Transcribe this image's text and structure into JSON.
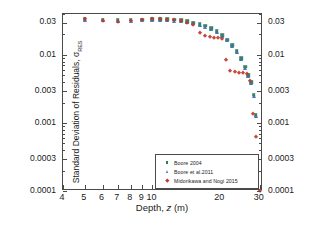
{
  "figure": {
    "background": "#ffffff",
    "frame_color": "#4a4a4a"
  },
  "axes": {
    "x_title_main": "Depth, ",
    "x_title_var": "z",
    "x_title_unit": " (m)",
    "y_title": "Standard Deviation of Residuals, σ",
    "y_title_sub": "RES"
  },
  "legend": {
    "position": "lower-right-inside",
    "entries": [
      {
        "label": "Boore 2004",
        "color": "#2e7d4f",
        "marker": "square"
      },
      {
        "label": "Boore et al.2011",
        "color": "#3d6fb5",
        "marker": "triangle"
      },
      {
        "label": "Midorikawa and Nogi 2015",
        "color": "#c0392b",
        "marker": "diamond"
      }
    ]
  },
  "caption": "",
  "chart_data": {
    "type": "scatter",
    "title": "",
    "xlabel": "Depth, z (m)",
    "ylabel": "Standard Deviation of Residuals, σRES",
    "xscale": "log",
    "yscale": "log",
    "xlim": [
      4,
      31
    ],
    "ylim": [
      0.0001,
      0.04
    ],
    "grid": false,
    "xticks_major": [
      4,
      5,
      6,
      7,
      8,
      9,
      10,
      20,
      30
    ],
    "xticklabels": [
      "4",
      "5",
      "6",
      "7",
      "8",
      "9",
      "10",
      "20",
      "30"
    ],
    "yticks_major": [
      0.0001,
      0.0003,
      0.001,
      0.003,
      0.01,
      0.03
    ],
    "yticklabels": [
      "0.0001",
      "0.0003",
      "0.001",
      "0.003",
      "0.01",
      "0.03"
    ],
    "series": [
      {
        "name": "Boore 2004",
        "color": "#2e7d4f",
        "marker": "square",
        "points": [
          [
            5.0,
            0.0335
          ],
          [
            6.0,
            0.0332
          ],
          [
            7.0,
            0.033
          ],
          [
            8.0,
            0.033
          ],
          [
            9.0,
            0.0332
          ],
          [
            10.0,
            0.0333
          ],
          [
            10.8,
            0.0334
          ],
          [
            11.6,
            0.0333
          ],
          [
            12.5,
            0.0328
          ],
          [
            13.4,
            0.0322
          ],
          [
            14.3,
            0.0313
          ],
          [
            15.2,
            0.03
          ],
          [
            16.2,
            0.0285
          ],
          [
            17.2,
            0.0268
          ],
          [
            18.2,
            0.0248
          ],
          [
            19.3,
            0.0222
          ],
          [
            20.4,
            0.0196
          ],
          [
            21.5,
            0.0168
          ],
          [
            22.6,
            0.014
          ],
          [
            23.7,
            0.0113
          ],
          [
            24.8,
            0.0089
          ],
          [
            25.8,
            0.0067
          ],
          [
            26.7,
            0.005
          ],
          [
            27.5,
            0.004
          ],
          [
            28.2,
            0.0026
          ],
          [
            28.8,
            0.0013
          ]
        ]
      },
      {
        "name": "Boore et al.2011",
        "color": "#3d6fb5",
        "marker": "triangle",
        "points": [
          [
            5.0,
            0.0332
          ],
          [
            6.0,
            0.0326
          ],
          [
            7.0,
            0.032
          ],
          [
            8.0,
            0.032
          ],
          [
            9.0,
            0.0322
          ],
          [
            10.0,
            0.0323
          ],
          [
            10.8,
            0.0324
          ],
          [
            11.6,
            0.0322
          ],
          [
            12.5,
            0.0318
          ],
          [
            13.4,
            0.0312
          ],
          [
            14.3,
            0.0303
          ],
          [
            15.2,
            0.0291
          ],
          [
            16.2,
            0.0277
          ],
          [
            17.2,
            0.026
          ],
          [
            18.2,
            0.0241
          ],
          [
            19.3,
            0.0216
          ],
          [
            20.4,
            0.0191
          ],
          [
            21.5,
            0.0164
          ],
          [
            22.6,
            0.0137
          ],
          [
            23.7,
            0.011
          ],
          [
            24.8,
            0.0087
          ],
          [
            25.8,
            0.0065
          ],
          [
            26.7,
            0.0049
          ],
          [
            27.5,
            0.0039
          ],
          [
            28.2,
            0.0025
          ],
          [
            28.8,
            0.00125
          ]
        ]
      },
      {
        "name": "Midorikawa and Nogi 2015",
        "color": "#c0392b",
        "marker": "diamond",
        "points": [
          [
            5.0,
            0.0333
          ],
          [
            6.0,
            0.032
          ],
          [
            7.0,
            0.0305
          ],
          [
            8.0,
            0.0318
          ],
          [
            9.0,
            0.033
          ],
          [
            10.0,
            0.0334
          ],
          [
            10.8,
            0.0335
          ],
          [
            11.6,
            0.033
          ],
          [
            12.5,
            0.0322
          ],
          [
            13.4,
            0.0312
          ],
          [
            14.3,
            0.0298
          ],
          [
            15.2,
            0.028
          ],
          [
            16.2,
            0.021
          ],
          [
            17.2,
            0.0188
          ],
          [
            18.0,
            0.0183
          ],
          [
            18.8,
            0.018
          ],
          [
            19.6,
            0.0176
          ],
          [
            20.4,
            0.0172
          ],
          [
            21.2,
            0.0084
          ],
          [
            22.2,
            0.0058
          ],
          [
            23.2,
            0.0056
          ],
          [
            24.2,
            0.0055
          ],
          [
            25.2,
            0.0054
          ],
          [
            26.2,
            0.0052
          ],
          [
            27.0,
            0.0041
          ],
          [
            28.0,
            0.00135
          ],
          [
            28.8,
            0.00062
          ],
          [
            30.0,
            0.0001
          ]
        ]
      }
    ]
  }
}
